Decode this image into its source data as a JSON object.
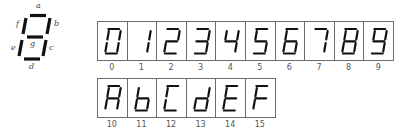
{
  "legend": {
    "segments": [
      "a",
      "b",
      "c",
      "d",
      "e",
      "f",
      "g"
    ],
    "labels": {
      "a": "a",
      "b": "b",
      "c": "c",
      "d": "d",
      "e": "e",
      "f": "f",
      "g": "g"
    }
  },
  "rows": [
    {
      "glyphs": [
        {
          "char": "0",
          "segments": "abcdef",
          "label": "0"
        },
        {
          "char": "1",
          "segments": "bc",
          "label": "1"
        },
        {
          "char": "2",
          "segments": "abdeg",
          "label": "2"
        },
        {
          "char": "3",
          "segments": "abcdg",
          "label": "3"
        },
        {
          "char": "4",
          "segments": "bcfg",
          "label": "4"
        },
        {
          "char": "5",
          "segments": "acdfg",
          "label": "5"
        },
        {
          "char": "6",
          "segments": "acdefg",
          "label": "6"
        },
        {
          "char": "7",
          "segments": "abc",
          "label": "7"
        },
        {
          "char": "8",
          "segments": "abcdefg",
          "label": "8"
        },
        {
          "char": "9",
          "segments": "abcdfg",
          "label": "9"
        }
      ]
    },
    {
      "glyphs": [
        {
          "char": "A",
          "segments": "abcefg",
          "label": "10"
        },
        {
          "char": "b",
          "segments": "cdefg",
          "label": "11"
        },
        {
          "char": "C",
          "segments": "adef",
          "label": "12"
        },
        {
          "char": "d",
          "segments": "bcdeg",
          "label": "13"
        },
        {
          "char": "E",
          "segments": "adefg",
          "label": "14"
        },
        {
          "char": "F",
          "segments": "aefg",
          "label": "15"
        }
      ]
    }
  ],
  "colors": {
    "segment": "#111111",
    "border": "#6b6b6b",
    "label": "#555555"
  }
}
